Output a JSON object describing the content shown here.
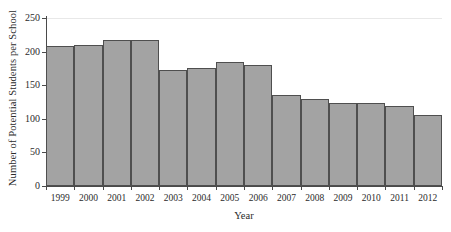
{
  "chart_data": {
    "type": "bar",
    "title": "",
    "xlabel": "Year",
    "ylabel": "Number of Potential Students per School",
    "categories": [
      "1999",
      "2000",
      "2001",
      "2002",
      "2003",
      "2004",
      "2005",
      "2006",
      "2007",
      "2008",
      "2009",
      "2010",
      "2011",
      "2012"
    ],
    "values": [
      208,
      210,
      217,
      217,
      173,
      175,
      185,
      180,
      136,
      129,
      124,
      124,
      119,
      106
    ],
    "series": [
      {
        "name": "Number of Potential Students per School",
        "values": [
          208,
          210,
          217,
          217,
          173,
          175,
          185,
          180,
          136,
          129,
          124,
          124,
          119,
          106
        ]
      }
    ],
    "ylim": [
      0,
      250
    ],
    "yticks": [
      0,
      50,
      100,
      150,
      200,
      250
    ],
    "ytick_labels": [
      "0",
      "50",
      "100",
      "150",
      "200",
      "250"
    ],
    "grid": false,
    "legend": "none",
    "bar_color": "#a3a3a3",
    "bar_edge_color": "#4f4f4f",
    "axis_color": "#4a4a4a",
    "background_color": "#ffffff"
  }
}
